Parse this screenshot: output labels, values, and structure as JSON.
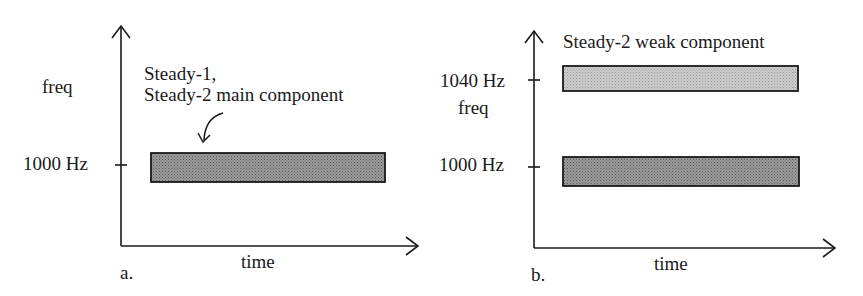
{
  "panels": [
    {
      "id": "a",
      "caption": "a.",
      "y_axis_label": "freq",
      "x_axis_label": "time",
      "ticks": [
        {
          "label": "1000 Hz",
          "value": 1000
        }
      ],
      "annotation": {
        "line1": "Steady-1,",
        "line2": "Steady-2 main component"
      },
      "bars": [
        {
          "name": "Steady-1 / Steady-2 main component",
          "freq_hz": 1000,
          "shade": "dark",
          "color": "#8a8a8a"
        }
      ]
    },
    {
      "id": "b",
      "caption": "b.",
      "y_axis_label": "freq",
      "x_axis_label": "time",
      "ticks": [
        {
          "label": "1040 Hz",
          "value": 1040
        },
        {
          "label": "1000 Hz",
          "value": 1000
        }
      ],
      "annotation": {
        "line1": "Steady-2 weak component"
      },
      "bars": [
        {
          "name": "Steady-2 weak component",
          "freq_hz": 1040,
          "shade": "light",
          "color": "#bdbdbd"
        },
        {
          "name": "Steady-2 main component",
          "freq_hz": 1000,
          "shade": "dark",
          "color": "#8a8a8a"
        }
      ]
    }
  ]
}
